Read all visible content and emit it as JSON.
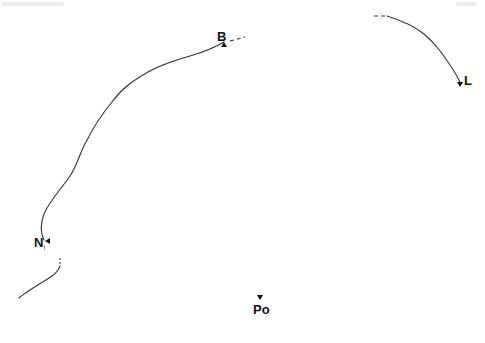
{
  "figure": {
    "stroke_color": "#333333",
    "label_color": "#111111",
    "points": [
      {
        "id": "B",
        "label": "B",
        "marker": "up",
        "x": 223,
        "y": 44
      },
      {
        "id": "L",
        "label": "L",
        "marker": "down",
        "x": 461,
        "y": 82
      },
      {
        "id": "N",
        "label": "N",
        "marker": "left",
        "x": 46,
        "y": 241
      },
      {
        "id": "Po",
        "label": "Po",
        "marker": "down",
        "x": 260,
        "y": 297
      }
    ],
    "paths": [
      {
        "id": "main-arc",
        "from": "N",
        "to": "B",
        "style": "solid"
      },
      {
        "id": "b-continuation",
        "from": "B",
        "style": "dashed"
      },
      {
        "id": "l-arc",
        "to": "L",
        "style": "solid"
      },
      {
        "id": "l-continuation",
        "style": "dashed"
      },
      {
        "id": "lower-left-arc",
        "style": "solid"
      },
      {
        "id": "lower-left-continuation",
        "style": "dashed"
      }
    ]
  }
}
